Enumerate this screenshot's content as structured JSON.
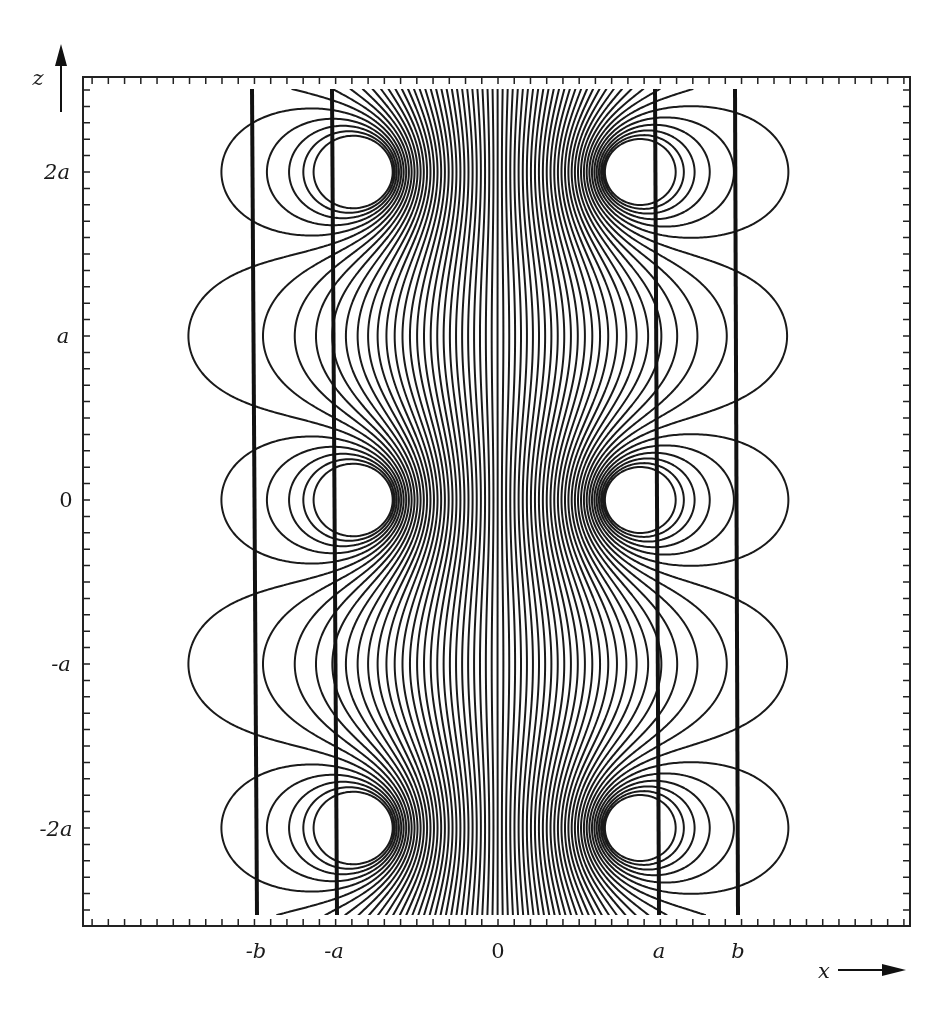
{
  "chart_data": {
    "type": "contour",
    "title": "",
    "xlabel": "x",
    "ylabel": "z",
    "x_tick_labels": [
      "-b",
      "-a",
      "0",
      "a",
      "b"
    ],
    "z_tick_labels": [
      "2a",
      "a",
      "0",
      "-a",
      "-2a"
    ],
    "axis_arrows": {
      "x": "right",
      "z": "up"
    },
    "grid": false,
    "legend": null,
    "o_points": [
      {
        "x": "-c",
        "z": "2a"
      },
      {
        "x": "c",
        "z": "2a"
      },
      {
        "x": "-c",
        "z": "0"
      },
      {
        "x": "c",
        "z": "0"
      },
      {
        "x": "-c",
        "z": "-2a"
      },
      {
        "x": "c",
        "z": "-2a"
      }
    ],
    "x_points": [
      {
        "x": "0",
        "z": "a"
      },
      {
        "x": "0",
        "z": "-a"
      }
    ],
    "bold_vertical_lines": [
      "-b",
      "-a",
      "a",
      "b"
    ],
    "z_period": "2a",
    "xlim": [
      "-2.6a",
      "2.6a"
    ],
    "zlim": [
      "-2.6a",
      "2.6a"
    ],
    "line_color": "#1a1a1a"
  },
  "labels": {
    "z_axis": "z",
    "x_axis": "x",
    "z_ticks": [
      {
        "text": "2a",
        "y": 172
      },
      {
        "text": "a",
        "y": 336
      },
      {
        "text": "0",
        "y": 500
      },
      {
        "text": "-a",
        "y": 664
      },
      {
        "text": "-2a",
        "y": 829
      }
    ],
    "x_ticks": [
      {
        "text": "-b",
        "x": 256
      },
      {
        "text": "-a",
        "x": 334
      },
      {
        "text": "0",
        "x": 498
      },
      {
        "text": "a",
        "x": 659
      },
      {
        "text": "b",
        "x": 738
      }
    ]
  }
}
